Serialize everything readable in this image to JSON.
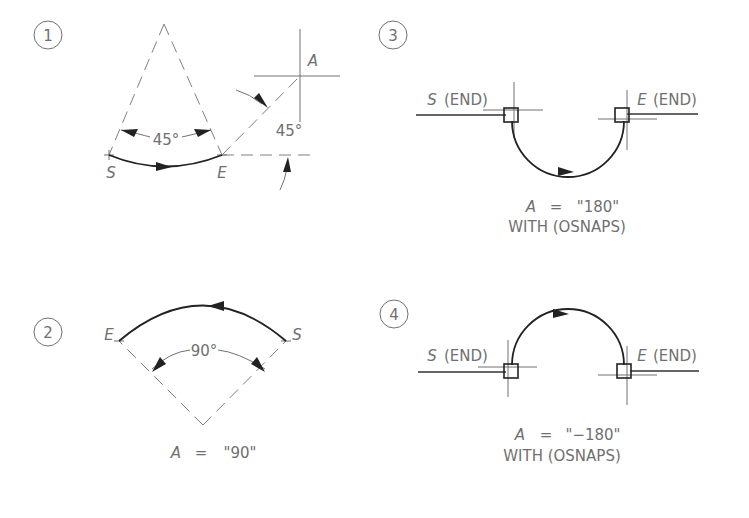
{
  "figures": [
    {
      "number": "1",
      "start_label": "S",
      "end_label": "E",
      "included_angle_label": "45°",
      "direction_point_label": "A",
      "direction_angle_label": "45°"
    },
    {
      "number": "2",
      "start_label": "S",
      "end_label": "E",
      "included_angle_label": "90°",
      "caption_var": "A",
      "caption_eq": "=",
      "caption_value": "\"90\""
    },
    {
      "number": "3",
      "start_label": "S",
      "start_suffix": "(END)",
      "end_label": "E",
      "end_suffix": "(END)",
      "caption_var": "A",
      "caption_eq": "=",
      "caption_value": "\"180\"",
      "caption_line2": "WITH  (OSNAPS)"
    },
    {
      "number": "4",
      "start_label": "S",
      "start_suffix": "(END)",
      "end_label": "E",
      "end_suffix": "(END)",
      "caption_var": "A",
      "caption_eq": "=",
      "caption_value": "\"−180\"",
      "caption_line2": "WITH  (OSNAPS)"
    }
  ],
  "colors": {
    "line": "#222222",
    "text": "#707070",
    "construction": "#808080"
  }
}
